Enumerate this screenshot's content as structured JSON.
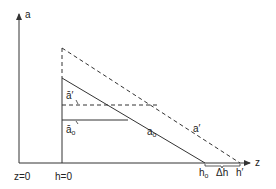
{
  "diagram": {
    "colors": {
      "line": "#333333",
      "background": "#ffffff"
    },
    "axes": {
      "vertical_label": "a",
      "horizontal_label": "z"
    },
    "bottom_labels": {
      "z0": "z=0",
      "h0_origin": "h=0",
      "h_o": "h",
      "h_o_sub": "o",
      "delta_h": "Δh",
      "h_prime": "h′"
    },
    "line_labels": {
      "a_o": "a",
      "a_o_sub": "o",
      "a_prime": "a′",
      "abar_prime": "ā′",
      "abar_o": "ā",
      "abar_o_sub": "o"
    },
    "lines": [
      {
        "name": "a_o",
        "style": "solid",
        "description": "linear profile from h=0 to h_o"
      },
      {
        "name": "a_prime",
        "style": "dashed",
        "description": "linear profile from h=0 to h′"
      },
      {
        "name": "abar_prime",
        "style": "dashed",
        "description": "horizontal mean level ā′"
      },
      {
        "name": "abar_o",
        "style": "solid",
        "description": "horizontal mean level ā_o"
      }
    ]
  }
}
